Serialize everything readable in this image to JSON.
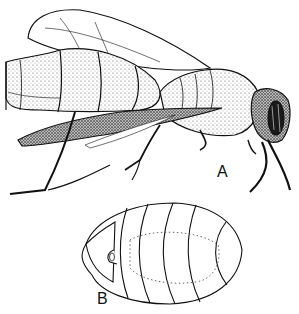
{
  "figure": {
    "labels": {
      "a": "A",
      "b": "B"
    },
    "parts": {
      "a": "adult wasp, lateral view",
      "b": "larva / pupa, dorsal view"
    },
    "colors": {
      "ink": "#111111",
      "paper": "#ffffff",
      "stipple": "#6a6a6a"
    }
  }
}
